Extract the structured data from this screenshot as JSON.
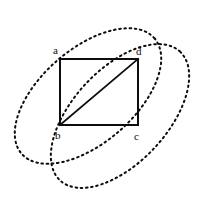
{
  "figure": {
    "background_color": "#ffffff",
    "stroke_color": "#0d0d0d",
    "canvas": {
      "width": 204,
      "height": 200
    },
    "rectangle": {
      "name": "abcd",
      "x": 60,
      "y": 59,
      "width": 78,
      "height": 66,
      "stroke_width": 1.6,
      "fill": "none"
    },
    "diagonal": {
      "from_label": "b",
      "to_label": "d",
      "x1": 60,
      "y1": 125,
      "x2": 138,
      "y2": 59,
      "stroke_width": 1.8
    },
    "labels": [
      {
        "id": "a",
        "text": "a",
        "x": 53,
        "y": 45,
        "corner": "top-left"
      },
      {
        "id": "d",
        "text": "d",
        "x": 136,
        "y": 46,
        "corner": "top-right"
      },
      {
        "id": "b",
        "text": "b",
        "x": 55,
        "y": 130,
        "corner": "bottom-left"
      },
      {
        "id": "c",
        "text": "c",
        "x": 134,
        "y": 131,
        "corner": "bottom-right"
      }
    ],
    "ellipses": [
      {
        "id": "ellipse-1",
        "cx": 88,
        "cy": 96,
        "rx": 88,
        "ry": 47,
        "rotation_deg": -41,
        "dash": "1.6 3.6",
        "stroke_width": 2.0
      },
      {
        "id": "ellipse-2",
        "cx": 120,
        "cy": 116,
        "rx": 88,
        "ry": 47,
        "rotation_deg": -47,
        "dash": "1.6 3.6",
        "stroke_width": 2.0
      }
    ]
  }
}
